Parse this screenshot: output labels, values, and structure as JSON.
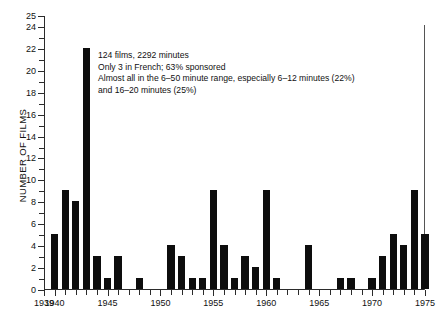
{
  "chart_data": {
    "type": "bar",
    "title": "",
    "xlabel": "",
    "ylabel": "NUMBER OF FILMS",
    "xlim": [
      1939,
      1975
    ],
    "ylim": [
      0,
      25
    ],
    "grid": false,
    "legend": null,
    "bar_color": "#0d0d0d",
    "y_ticks": [
      0,
      1,
      2,
      3,
      4,
      5,
      6,
      7,
      8,
      9,
      10,
      11,
      12,
      13,
      14,
      15,
      16,
      17,
      18,
      19,
      20,
      21,
      22,
      23,
      24,
      25
    ],
    "y_tick_labels": [
      {
        "value": 0,
        "label": "0"
      },
      {
        "value": 2,
        "label": "2"
      },
      {
        "value": 4,
        "label": "4"
      },
      {
        "value": 6,
        "label": "6"
      },
      {
        "value": 8,
        "label": "8"
      },
      {
        "value": 10,
        "label": "10"
      },
      {
        "value": 12,
        "label": "12"
      },
      {
        "value": 14,
        "label": "14"
      },
      {
        "value": 16,
        "label": "16"
      },
      {
        "value": 18,
        "label": "18"
      },
      {
        "value": 20,
        "label": "20"
      },
      {
        "value": 22,
        "label": "22"
      },
      {
        "value": 24,
        "label": "24"
      },
      {
        "value": 25,
        "label": "25"
      }
    ],
    "x_tick_labels": [
      {
        "value": 1939,
        "label": "1939"
      },
      {
        "value": 1940,
        "label": "1940"
      },
      {
        "value": 1945,
        "label": "1945"
      },
      {
        "value": 1950,
        "label": "1950"
      },
      {
        "value": 1955,
        "label": "1955"
      },
      {
        "value": 1960,
        "label": "1960"
      },
      {
        "value": 1965,
        "label": "1965"
      },
      {
        "value": 1970,
        "label": "1970"
      },
      {
        "value": 1975,
        "label": "1975"
      }
    ],
    "categories": [
      1939,
      1940,
      1941,
      1942,
      1943,
      1944,
      1945,
      1946,
      1947,
      1948,
      1949,
      1950,
      1951,
      1952,
      1953,
      1954,
      1955,
      1956,
      1957,
      1958,
      1959,
      1960,
      1961,
      1962,
      1963,
      1964,
      1965,
      1966,
      1967,
      1968,
      1969,
      1970,
      1971,
      1972,
      1973,
      1974,
      1975
    ],
    "values": [
      0,
      5,
      9,
      8,
      22,
      3,
      1,
      3,
      0,
      1,
      0,
      0,
      4,
      3,
      1,
      1,
      9,
      4,
      1,
      3,
      2,
      9,
      1,
      0,
      0,
      4,
      0,
      0,
      1,
      1,
      0,
      1,
      3,
      5,
      4,
      9,
      5
    ],
    "annotations": [
      "124 films, 2292 minutes",
      "Only 3 in French; 63% sponsored",
      "Almost all in the 6–50 minute range, especially 6–12 minutes (22%)",
      "and 16–20 minutes (25%)"
    ]
  },
  "caption": {
    "text": ""
  }
}
